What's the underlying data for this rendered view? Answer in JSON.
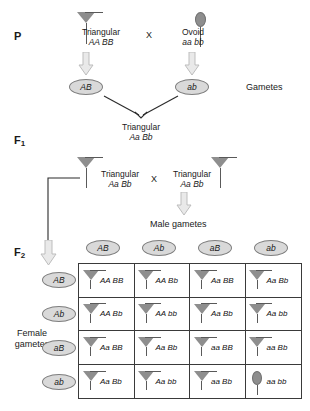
{
  "generations": {
    "p_label": "P",
    "f1_label": "F",
    "f1_sub": "1",
    "f2_label": "F",
    "f2_sub": "2"
  },
  "p_cross": {
    "parent1": {
      "phenotype": "Triangular",
      "genotype": "AA BB",
      "shape": "triangular"
    },
    "cross_symbol": "X",
    "parent2": {
      "phenotype": "Ovoid",
      "genotype": "aa bb",
      "shape": "ovoid"
    },
    "gamete1": "AB",
    "gamete2": "ab",
    "gametes_label": "Gametes"
  },
  "f1_offspring": {
    "phenotype": "Triangular",
    "genotype": "Aa Bb"
  },
  "f1_cross": {
    "parent1": {
      "phenotype": "Triangular",
      "genotype": "Aa Bb",
      "shape": "triangular"
    },
    "cross_symbol": "X",
    "parent2": {
      "phenotype": "Triangular",
      "genotype": "Aa Bb",
      "shape": "triangular"
    }
  },
  "punnett": {
    "male_gametes_label": "Male gametes",
    "female_gametes_label_line1": "Female",
    "female_gametes_label_line2": "gametes",
    "columns": [
      "AB",
      "Ab",
      "aB",
      "ab"
    ],
    "rows": [
      "AB",
      "Ab",
      "aB",
      "ab"
    ],
    "cells": [
      {
        "genotype": "AA BB",
        "shape": "triangular"
      },
      {
        "genotype": "AA Bb",
        "shape": "triangular"
      },
      {
        "genotype": "Aa BB",
        "shape": "triangular"
      },
      {
        "genotype": "Aa Bb",
        "shape": "triangular"
      },
      {
        "genotype": "AA Bb",
        "shape": "triangular"
      },
      {
        "genotype": "AA bb",
        "shape": "triangular"
      },
      {
        "genotype": "Aa Bb",
        "shape": "triangular"
      },
      {
        "genotype": "Aa bb",
        "shape": "triangular"
      },
      {
        "genotype": "Aa BB",
        "shape": "triangular"
      },
      {
        "genotype": "Aa Bb",
        "shape": "triangular"
      },
      {
        "genotype": "aa BB",
        "shape": "triangular"
      },
      {
        "genotype": "aa Bb",
        "shape": "triangular"
      },
      {
        "genotype": "Aa Bb",
        "shape": "triangular"
      },
      {
        "genotype": "Aa bb",
        "shape": "triangular"
      },
      {
        "genotype": "aa Bb",
        "shape": "triangular"
      },
      {
        "genotype": "aa bb",
        "shape": "ovoid"
      }
    ]
  },
  "colors": {
    "shape_fill": "#8e8e8e",
    "gamete_fill": "#d9d9d9",
    "grid_line": "#3a3a3a",
    "arrow_fill": "#e8e8e8",
    "arrow_stroke": "#b4b4b4",
    "text": "#1a1a1a"
  }
}
